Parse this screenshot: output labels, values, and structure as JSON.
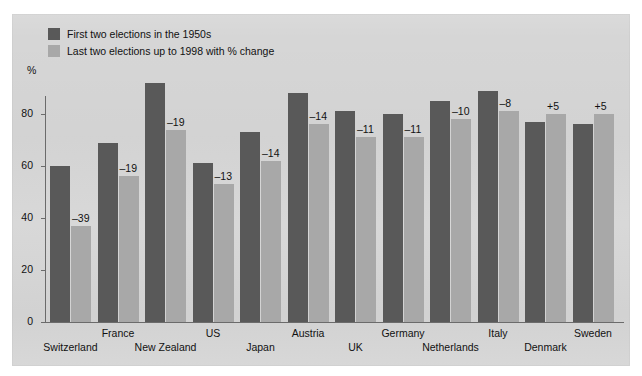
{
  "axis": {
    "y_unit_label": "%",
    "y_ticks": [
      "0",
      "20",
      "40",
      "60",
      "80"
    ]
  },
  "legend": {
    "series": [
      {
        "key": "first",
        "label": "First two elections in the 1950s",
        "color": "#595959",
        "swatch": "dark-swatch-icon"
      },
      {
        "key": "last",
        "label": "Last two elections up to 1998 with % change",
        "color": "#a8a8a8",
        "swatch": "light-swatch-icon"
      }
    ]
  },
  "chart_data": {
    "type": "bar",
    "title": "",
    "subtitle": "",
    "xlabel": "",
    "ylabel": "%",
    "ylim": [
      0,
      95
    ],
    "grid": false,
    "legend_position": "top-left",
    "categories": [
      "Switzerland",
      "France",
      "New Zealand",
      "US",
      "Japan",
      "Austria",
      "UK",
      "Germany",
      "Netherlands",
      "Italy",
      "Denmark",
      "Sweden"
    ],
    "series": [
      {
        "name": "First two elections in the 1950s",
        "color": "#595959",
        "values": [
          60,
          69,
          92,
          61,
          73,
          88,
          81,
          80,
          85,
          89,
          77,
          76
        ]
      },
      {
        "name": "Last two elections up to 1998 with % change",
        "color": "#a8a8a8",
        "values": [
          37,
          56,
          74,
          53,
          62,
          76,
          71,
          71,
          78,
          81,
          80,
          80
        ]
      }
    ],
    "annotations": [
      {
        "category": "Switzerland",
        "label": "–39",
        "value": -39
      },
      {
        "category": "France",
        "label": "–19",
        "value": -19
      },
      {
        "category": "New Zealand",
        "label": "–19",
        "value": -19
      },
      {
        "category": "US",
        "label": "–13",
        "value": -13
      },
      {
        "category": "Japan",
        "label": "–14",
        "value": -14
      },
      {
        "category": "Austria",
        "label": "–14",
        "value": -14
      },
      {
        "category": "UK",
        "label": "–11",
        "value": -11
      },
      {
        "category": "Germany",
        "label": "–11",
        "value": -11
      },
      {
        "category": "Netherlands",
        "label": "–10",
        "value": -10
      },
      {
        "category": "Italy",
        "label": "–8",
        "value": -8
      },
      {
        "category": "Denmark",
        "label": "+5",
        "value": 5
      },
      {
        "category": "Sweden",
        "label": "+5",
        "value": 5
      }
    ]
  },
  "colors": {
    "panel_background": "#d6d6d6",
    "page_background": "#ffffff",
    "axis": "#6b6b6b",
    "series_first": "#595959",
    "series_last": "#a8a8a8",
    "text": "#111111"
  }
}
